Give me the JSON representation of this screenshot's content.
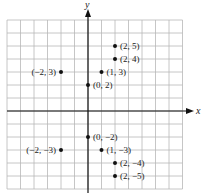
{
  "axes": {
    "x_label": "x",
    "y_label": "y"
  },
  "grid": {
    "x_min": -6,
    "x_max": 7,
    "y_min": -6,
    "y_max": 7
  },
  "colors": {
    "grid": "#b8b8b8",
    "axis": "#111111",
    "point": "#111111",
    "text": "#222222"
  },
  "points": [
    {
      "x": 2,
      "y": 5,
      "label": "(2, 5)",
      "side": "right"
    },
    {
      "x": 2,
      "y": 4,
      "label": "(2, 4)",
      "side": "right"
    },
    {
      "x": -2,
      "y": 3,
      "label": "(−2, 3)",
      "side": "left"
    },
    {
      "x": 1,
      "y": 3,
      "label": "(1, 3)",
      "side": "right"
    },
    {
      "x": 0,
      "y": 2,
      "label": "(0, 2)",
      "side": "right"
    },
    {
      "x": 0,
      "y": -2,
      "label": "(0, −2)",
      "side": "right"
    },
    {
      "x": -2,
      "y": -3,
      "label": "(−2, −3)",
      "side": "left"
    },
    {
      "x": 1,
      "y": -3,
      "label": "(1, −3)",
      "side": "right"
    },
    {
      "x": 2,
      "y": -4,
      "label": "(2, −4)",
      "side": "right"
    },
    {
      "x": 2,
      "y": -5,
      "label": "(2, −5)",
      "side": "right"
    }
  ]
}
